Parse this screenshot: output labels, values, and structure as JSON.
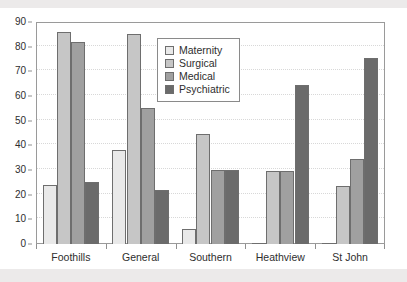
{
  "chart_data": {
    "type": "bar",
    "title": "",
    "subtitle": "",
    "xlabel": "",
    "ylabel": "",
    "ylim": [
      0,
      90
    ],
    "y_ticks": [
      0,
      10,
      20,
      30,
      40,
      50,
      60,
      70,
      80,
      90
    ],
    "grid": true,
    "legend_position": "inside-top-center",
    "categories": [
      "Foothills",
      "General",
      "Southern",
      "Heathview",
      "St John"
    ],
    "series": [
      {
        "name": "Maternity",
        "color": "#e9e9e9",
        "values": [
          24,
          38,
          6,
          0.3,
          0.3
        ]
      },
      {
        "name": "Surgical",
        "color": "#c6c6c6",
        "values": [
          86,
          85,
          44.5,
          29.5,
          23.5
        ]
      },
      {
        "name": "Medical",
        "color": "#a0a0a0",
        "values": [
          82,
          55,
          30,
          29.5,
          34.5
        ]
      },
      {
        "name": "Psychiatric",
        "color": "#6b6b6b",
        "values": [
          25,
          22,
          30,
          64.5,
          75.5
        ]
      }
    ]
  },
  "colors": {
    "plot_border": "#9a9a9a",
    "gridline": "#d8d8d8",
    "bar_outline": "#6e6e6e",
    "text": "#2e2e2e",
    "background": "#ffffff",
    "scan_band": "#eceaea"
  }
}
